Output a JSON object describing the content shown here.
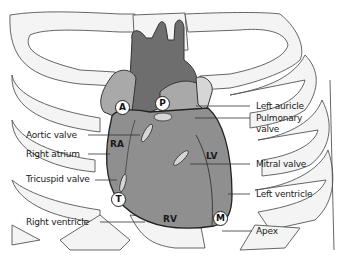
{
  "diagram": {
    "colors": {
      "background": "#ffffff",
      "rib_fill": "#f4f4f4",
      "rib_stroke": "#555555",
      "heart": "#8f8f8f",
      "great_vessels": "#6e6e6e",
      "atria_light": "#a9a9a9",
      "valves": "#d6d6d6"
    },
    "region_labels": {
      "ra": "RA",
      "lv": "LV",
      "rv": "RV"
    },
    "auscultation_points": {
      "aortic": "A",
      "pulmonary": "P",
      "tricuspid": "T",
      "mitral": "M"
    },
    "left_labels": [
      {
        "id": "aortic-valve",
        "text": "Aortic valve"
      },
      {
        "id": "right-atrium",
        "text": "Right atrium"
      },
      {
        "id": "tricuspid-valve",
        "text": "Tricuspid valve"
      },
      {
        "id": "right-ventricle",
        "text": "Right ventricle"
      }
    ],
    "right_labels": [
      {
        "id": "left-auricle",
        "text": "Left auricle"
      },
      {
        "id": "pulmonary-valve-1",
        "text": "Pulmonary"
      },
      {
        "id": "pulmonary-valve-2",
        "text": "valve"
      },
      {
        "id": "mitral-valve",
        "text": "Mitral valve"
      },
      {
        "id": "left-ventricle",
        "text": "Left ventricle"
      },
      {
        "id": "apex",
        "text": "Apex"
      }
    ]
  }
}
